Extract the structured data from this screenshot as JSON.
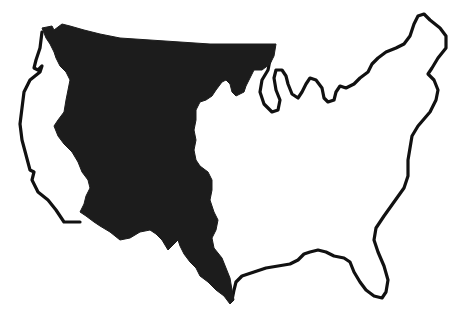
{
  "map": {
    "subject": "Outline map of the contiguous United States",
    "highlighted_region": {
      "label": "western territory (shaded)",
      "fill_color": "#1c1c1c"
    },
    "outline_color": "#111111",
    "background_color": "#ffffff"
  },
  "caption": {
    "text": ""
  }
}
